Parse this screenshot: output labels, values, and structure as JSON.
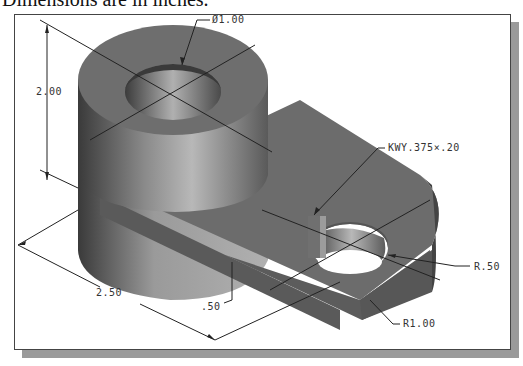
{
  "caption": "Dimensions are in inches.",
  "dimensions": {
    "hole_diameter": "Ø1.00",
    "height": "2.00",
    "keyway": "KWY.375×.20",
    "end_radius": "R.50",
    "length": "2.50",
    "base_thickness": ".50",
    "outer_radius": "R1.00"
  },
  "colors": {
    "frame_border": "#444444",
    "shadow": "#9a9a9a",
    "part_dark": "#4a4a4a",
    "part_mid": "#7c7c7c",
    "part_light": "#b5b5b5"
  }
}
